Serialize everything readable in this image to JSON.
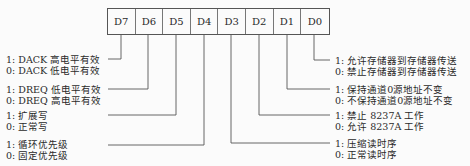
{
  "register": {
    "bits": [
      "D7",
      "D6",
      "D5",
      "D4",
      "D3",
      "D2",
      "D1",
      "D0"
    ]
  },
  "descriptions": {
    "d7": {
      "one": "1: DACK 高电平有效",
      "zero": "0: DACK 低电平有效"
    },
    "d6": {
      "one": "1: DREQ 低电平有效",
      "zero": "0: DREQ 高电平有效"
    },
    "d5": {
      "one": "1: 扩展写",
      "zero": "0: 正常写"
    },
    "d4": {
      "one": "1: 循环优先级",
      "zero": "0: 固定优先级"
    },
    "d3": {
      "one": "1: 压缩读时序",
      "zero": "0: 正常读时序"
    },
    "d2": {
      "one": "1: 禁止 8237A 工作",
      "zero": "0: 允许 8237A 工作"
    },
    "d1": {
      "one": "1: 保持通道0源地址不变",
      "zero": "0: 不保持通道0源地址不变"
    },
    "d0": {
      "one": "1: 允许存储器到存储器传送",
      "zero": "0: 禁止存储器到存储器传送"
    }
  }
}
